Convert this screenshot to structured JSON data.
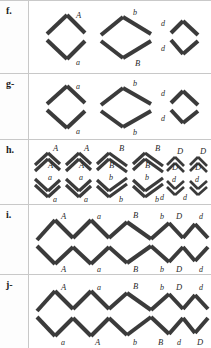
{
  "figure": {
    "type": "diagram",
    "stroke_color": "#3b3b3b",
    "border_color": "#c8c8c8",
    "background": "#ffffff"
  },
  "rows": [
    {
      "id": "f",
      "label": "f.",
      "groups": [
        {
          "name": "diamond-1",
          "shape": "diamond-narrow",
          "labels": [
            {
              "text": "A",
              "pos": "top-right"
            },
            {
              "text": "a",
              "pos": "bottom-right"
            }
          ]
        },
        {
          "name": "diamond-2",
          "shape": "diamond-wide",
          "labels": [
            {
              "text": "b",
              "pos": "top-right"
            },
            {
              "text": "B",
              "pos": "bottom-right"
            }
          ]
        },
        {
          "name": "diamond-3",
          "shape": "diamond-small",
          "labels": [
            {
              "text": "d",
              "pos": "top-left"
            },
            {
              "text": "d",
              "pos": "bottom-left"
            }
          ]
        }
      ]
    },
    {
      "id": "g",
      "label": "g-",
      "groups": [
        {
          "name": "diamond-1",
          "shape": "diamond-narrow",
          "labels": [
            {
              "text": "a",
              "pos": "top-right"
            },
            {
              "text": "a",
              "pos": "bottom-right"
            }
          ]
        },
        {
          "name": "diamond-2",
          "shape": "diamond-wide",
          "labels": [
            {
              "text": "b",
              "pos": "top-right"
            },
            {
              "text": "b",
              "pos": "bottom-right"
            }
          ]
        },
        {
          "name": "diamond-3",
          "shape": "diamond-small",
          "labels": [
            {
              "text": "d",
              "pos": "top-left"
            },
            {
              "text": "d",
              "pos": "bottom-left"
            }
          ]
        }
      ]
    },
    {
      "id": "h",
      "label": "h.",
      "groups": [
        {
          "name": "chevron-pair-1",
          "shape": "chevron-pair-narrow",
          "labels": [
            {
              "text": "A",
              "pos": "upper-top"
            },
            {
              "text": "A",
              "pos": "upper-bottom"
            },
            {
              "text": "a",
              "pos": "lower-top"
            },
            {
              "text": "a",
              "pos": "lower-bottom"
            }
          ]
        },
        {
          "name": "chevron-pair-2",
          "shape": "chevron-pair-narrow",
          "labels": [
            {
              "text": "A",
              "pos": "upper-top"
            },
            {
              "text": "A",
              "pos": "upper-bottom"
            },
            {
              "text": "a",
              "pos": "lower-top"
            },
            {
              "text": "a",
              "pos": "lower-bottom"
            }
          ]
        },
        {
          "name": "chevron-pair-3",
          "shape": "chevron-pair-wide",
          "labels": [
            {
              "text": "B",
              "pos": "upper-top"
            },
            {
              "text": "B",
              "pos": "upper-bottom"
            },
            {
              "text": "b",
              "pos": "lower-top"
            },
            {
              "text": "b",
              "pos": "lower-bottom"
            }
          ]
        },
        {
          "name": "chevron-pair-4",
          "shape": "chevron-pair-wide",
          "labels": [
            {
              "text": "B",
              "pos": "upper-top"
            },
            {
              "text": "B",
              "pos": "upper-bottom"
            },
            {
              "text": "b",
              "pos": "lower-top"
            },
            {
              "text": "b",
              "pos": "lower-bottom"
            }
          ]
        },
        {
          "name": "chevron-pair-5",
          "shape": "chevron-pair-small",
          "labels": [
            {
              "text": "D",
              "pos": "upper-top"
            },
            {
              "text": "D",
              "pos": "upper-bottom"
            },
            {
              "text": "d",
              "pos": "lower-top"
            },
            {
              "text": "d",
              "pos": "lower-bottom"
            }
          ]
        },
        {
          "name": "chevron-pair-6",
          "shape": "chevron-pair-small",
          "labels": [
            {
              "text": "D",
              "pos": "upper-top"
            },
            {
              "text": "D",
              "pos": "upper-bottom"
            },
            {
              "text": "d",
              "pos": "lower-top"
            },
            {
              "text": "d",
              "pos": "lower-bottom"
            }
          ]
        }
      ]
    },
    {
      "id": "i",
      "label": "i.",
      "chain": {
        "name": "zigzag-chain-matched",
        "top_labels": [
          "A",
          "a",
          "B",
          "b",
          "D",
          "d"
        ],
        "bottom_labels": [
          "A",
          "a",
          "B",
          "b",
          "D",
          "d"
        ]
      }
    },
    {
      "id": "j",
      "label": "j-",
      "chain": {
        "name": "zigzag-chain-swapped",
        "top_labels": [
          "A",
          "a",
          "B",
          "b",
          "D",
          "d"
        ],
        "bottom_labels": [
          "a",
          "A",
          "b",
          "B",
          "d",
          "D"
        ]
      }
    }
  ]
}
